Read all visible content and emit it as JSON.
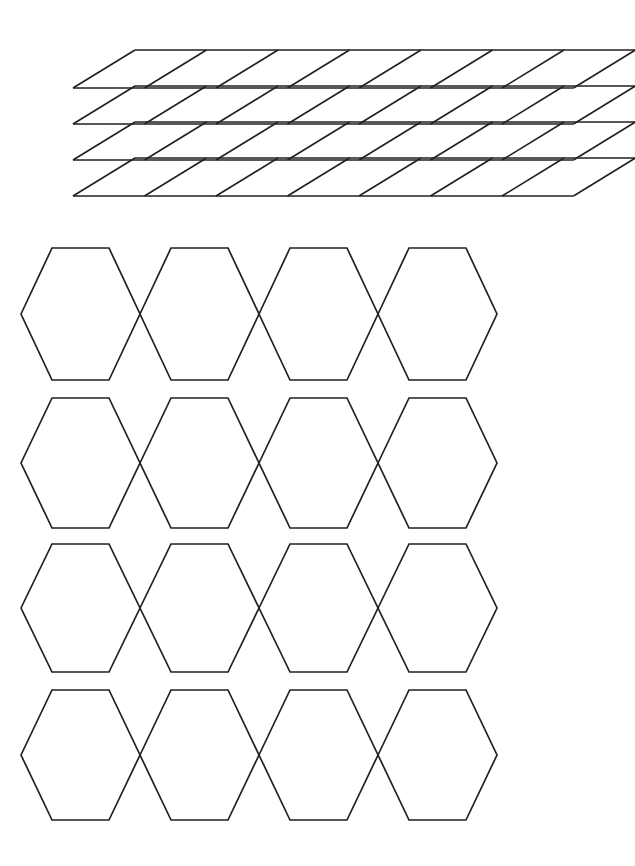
{
  "page": {
    "background_color": "#ffffff",
    "width": 635,
    "height": 866,
    "stroke_color": "#231f20"
  },
  "figures": [
    {
      "id": "rhombus-grid",
      "name": "sheared-parallelogram-grid",
      "shape_type": "rhombus",
      "description": "Oblique grid of parallelograms in perspective",
      "rows": 4,
      "columns": 7,
      "origin_x": 135,
      "origin_y": 50,
      "cell_width": 71.5,
      "row_height": 36,
      "shear_dx": -62,
      "shear_dy": 38,
      "stroke_width": 1.6
    },
    {
      "id": "hexagon-tiling",
      "name": "overlapping-hexagon-rows",
      "shape_type": "hexagon",
      "description": "Four rows of four flat-top hexagons meeting at shared side vertices",
      "rows": 4,
      "columns": 4,
      "row_tops": [
        248,
        398,
        544,
        690
      ],
      "row_bottoms": [
        380,
        528,
        672,
        820
      ],
      "left_vertex_x": 21,
      "column_pitch": 118.8,
      "top_edge_inset": 31,
      "point_inset": 31,
      "stroke_width": 1.7
    }
  ],
  "hexagon_rows": [
    {
      "row_index": 1,
      "top_y": 248,
      "bottom_y": 380,
      "mid_y": 314,
      "hexagons": [
        {
          "left_x": 21,
          "right_x": 140
        },
        {
          "left_x": 140,
          "right_x": 259
        },
        {
          "left_x": 259,
          "right_x": 378
        },
        {
          "left_x": 378,
          "right_x": 497
        }
      ]
    },
    {
      "row_index": 2,
      "top_y": 398,
      "bottom_y": 528,
      "mid_y": 463,
      "hexagons": [
        {
          "left_x": 21,
          "right_x": 140
        },
        {
          "left_x": 140,
          "right_x": 259
        },
        {
          "left_x": 259,
          "right_x": 378
        },
        {
          "left_x": 378,
          "right_x": 497
        }
      ]
    },
    {
      "row_index": 3,
      "top_y": 544,
      "bottom_y": 672,
      "mid_y": 608,
      "hexagons": [
        {
          "left_x": 21,
          "right_x": 140
        },
        {
          "left_x": 140,
          "right_x": 259
        },
        {
          "left_x": 259,
          "right_x": 378
        },
        {
          "left_x": 378,
          "right_x": 497
        }
      ]
    },
    {
      "row_index": 4,
      "top_y": 690,
      "bottom_y": 820,
      "mid_y": 755,
      "hexagons": [
        {
          "left_x": 21,
          "right_x": 140
        },
        {
          "left_x": 140,
          "right_x": 259
        },
        {
          "left_x": 259,
          "right_x": 378
        },
        {
          "left_x": 378,
          "right_x": 497
        }
      ]
    }
  ],
  "labels": {
    "rhombus_figure_caption": "",
    "hexagon_figure_caption": ""
  }
}
